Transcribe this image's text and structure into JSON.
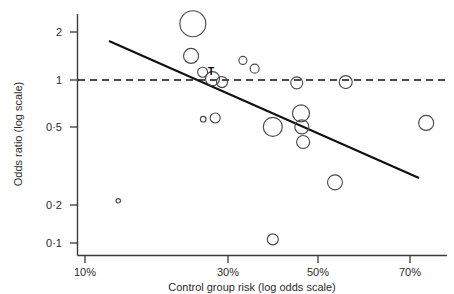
{
  "figure": {
    "background": "#ffffff",
    "ink_color": "#1a1a1a"
  },
  "chart_data": {
    "type": "scatter",
    "title": "",
    "subtitle": "",
    "xlabel": "Control group risk (log odds scale)",
    "ylabel": "Odds ratio (log scale)",
    "x_scale": "log-odds",
    "y_scale": "log",
    "grid": false,
    "legend": false,
    "xticks": [
      "10%",
      "30%",
      "50%",
      "70%"
    ],
    "xtick_values": [
      10,
      30,
      50,
      70
    ],
    "yticks": [
      "2",
      "1",
      "0·5",
      "0·2",
      "0·1"
    ],
    "ytick_values": [
      2,
      1,
      0.5,
      0.2,
      0.1
    ],
    "xlim": [
      8,
      78
    ],
    "ylim": [
      0.085,
      2.6
    ],
    "marker_style": "open-circle-size-weighted",
    "annotations": [
      {
        "text": "T",
        "x": 27.5,
        "y": 1.12,
        "bold": true
      }
    ],
    "reference_lines": [
      {
        "name": "null-effect",
        "type": "horizontal",
        "y": 1,
        "style": "dashed",
        "label": ""
      },
      {
        "name": "meta-regression",
        "type": "fitted",
        "style": "solid",
        "x_start": 13.5,
        "y_start": 1.72,
        "x_end": 71.5,
        "y_end": 0.285
      }
    ],
    "points": [
      {
        "id": "s1",
        "x": 13.2,
        "y": 0.172,
        "size": 2.2
      },
      {
        "id": "s2",
        "x": 23.5,
        "y": 2.27,
        "size": 13.0
      },
      {
        "id": "s3",
        "x": 23.2,
        "y": 1.42,
        "size": 7.5
      },
      {
        "id": "s4",
        "x": 25.2,
        "y": 1.12,
        "size": 5.0
      },
      {
        "id": "s5",
        "x": 27.0,
        "y": 1.02,
        "size": 7.0
      },
      {
        "id": "s6",
        "x": 28.8,
        "y": 0.97,
        "size": 5.5
      },
      {
        "id": "s7",
        "x": 33.0,
        "y": 1.33,
        "size": 4.0
      },
      {
        "id": "s8",
        "x": 35.5,
        "y": 1.18,
        "size": 4.5
      },
      {
        "id": "s9",
        "x": 25.3,
        "y": 0.565,
        "size": 2.8
      },
      {
        "id": "s10",
        "x": 27.5,
        "y": 0.575,
        "size": 5.0
      },
      {
        "id": "s11",
        "x": 39.5,
        "y": 0.505,
        "size": 9.5
      },
      {
        "id": "s12",
        "x": 46.0,
        "y": 0.615,
        "size": 8.5
      },
      {
        "id": "s13",
        "x": 46.2,
        "y": 0.505,
        "size": 7.0
      },
      {
        "id": "s14",
        "x": 46.5,
        "y": 0.405,
        "size": 6.5
      },
      {
        "id": "s15",
        "x": 45.0,
        "y": 0.96,
        "size": 6.0
      },
      {
        "id": "s16",
        "x": 56.5,
        "y": 0.97,
        "size": 6.5
      },
      {
        "id": "s17",
        "x": 54.0,
        "y": 0.225,
        "size": 7.5
      },
      {
        "id": "s18",
        "x": 39.5,
        "y": 0.098,
        "size": 5.5
      },
      {
        "id": "s19",
        "x": 73.5,
        "y": 0.535,
        "size": 7.5
      }
    ]
  }
}
